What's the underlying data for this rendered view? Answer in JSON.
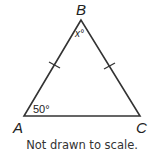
{
  "figure": {
    "type": "isosceles-triangle",
    "vertices": {
      "A": {
        "label": "A"
      },
      "B": {
        "label": "B"
      },
      "C": {
        "label": "C"
      }
    },
    "angles": {
      "A": {
        "label": "50°"
      },
      "B": {
        "label": "x°"
      }
    },
    "congruent_sides": [
      "AB",
      "BC"
    ],
    "stroke_color": "#333333",
    "caption": "Not drawn to scale."
  }
}
